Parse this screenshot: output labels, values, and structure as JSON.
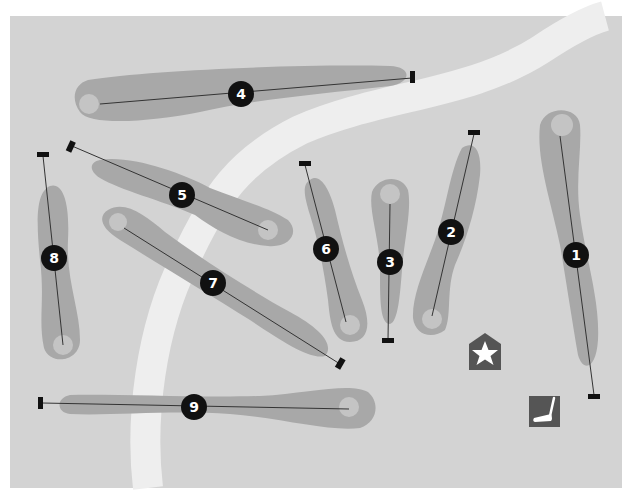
{
  "map": {
    "title": "Golf course layout",
    "colors": {
      "background": "#d3d3d3",
      "fairway": "#a8a8a8",
      "green": "#c4c4c4",
      "path": "#eeeeee",
      "marker": "#111111",
      "icon_bg": "#555555",
      "icon_fg": "#ffffff"
    },
    "holes": [
      {
        "number": "1"
      },
      {
        "number": "2"
      },
      {
        "number": "3"
      },
      {
        "number": "4"
      },
      {
        "number": "5"
      },
      {
        "number": "6"
      },
      {
        "number": "7"
      },
      {
        "number": "8"
      },
      {
        "number": "9"
      }
    ],
    "icons": {
      "clubhouse": "clubhouse-star-icon",
      "putting_green": "putter-icon"
    }
  }
}
